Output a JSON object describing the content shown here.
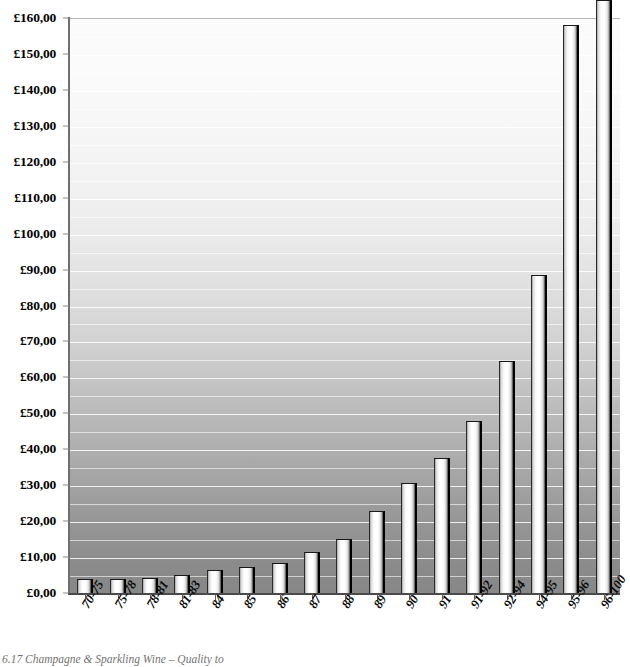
{
  "chart_data": {
    "type": "bar",
    "title": "",
    "xlabel": "",
    "ylabel": "",
    "categories": [
      "70-75",
      "75-78",
      "78-81",
      "81-83",
      "84",
      "85",
      "86",
      "87",
      "88",
      "89",
      "90",
      "91",
      "91-92",
      "92-94",
      "94-95",
      "95-96",
      "96-100"
    ],
    "values": [
      4.0,
      4.0,
      4.2,
      5.0,
      6.3,
      7.2,
      8.3,
      11.5,
      15.0,
      22.8,
      30.5,
      37.5,
      48.0,
      64.5,
      88.5,
      158.0,
      159.5
    ],
    "ylim": [
      0,
      160
    ],
    "ytick_values": [
      0,
      10,
      20,
      30,
      40,
      50,
      60,
      70,
      80,
      90,
      100,
      110,
      120,
      130,
      140,
      150,
      160
    ],
    "ytick_labels": [
      "£0,00",
      "£10,00",
      "£20,00",
      "£30,00",
      "£40,00",
      "£50,00",
      "£60,00",
      "£70,00",
      "£80,00",
      "£90,00",
      "£100,00",
      "£110,00",
      "£120,00",
      "£130,00",
      "£140,00",
      "£150,00",
      "£160,00"
    ],
    "gridlines": {
      "enabled": true,
      "minor_step": 5,
      "color": "#ffffff"
    },
    "legend": {
      "visible": false,
      "position": "none"
    },
    "currency_symbol": "£",
    "decimal_separator": ",",
    "bar_style": {
      "fill_gradient_start": "#ffffff",
      "fill_gradient_end": "#cfcfcf",
      "edge_color": "#000000"
    },
    "plot_background": {
      "gradient_top": "#fcfcfc",
      "gradient_bottom": "#878787"
    }
  },
  "caption": {
    "text": "6.17  Champagne & Sparkling Wine – Quality to"
  }
}
